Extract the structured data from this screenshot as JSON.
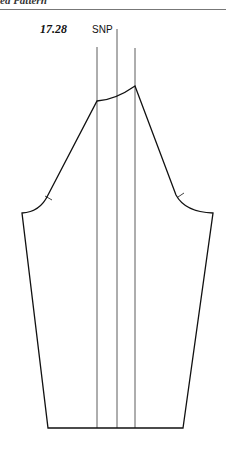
{
  "header": {
    "title": "ed Pattern"
  },
  "figure": {
    "number": "17.28",
    "labels": {
      "snp": "SNP"
    }
  }
}
